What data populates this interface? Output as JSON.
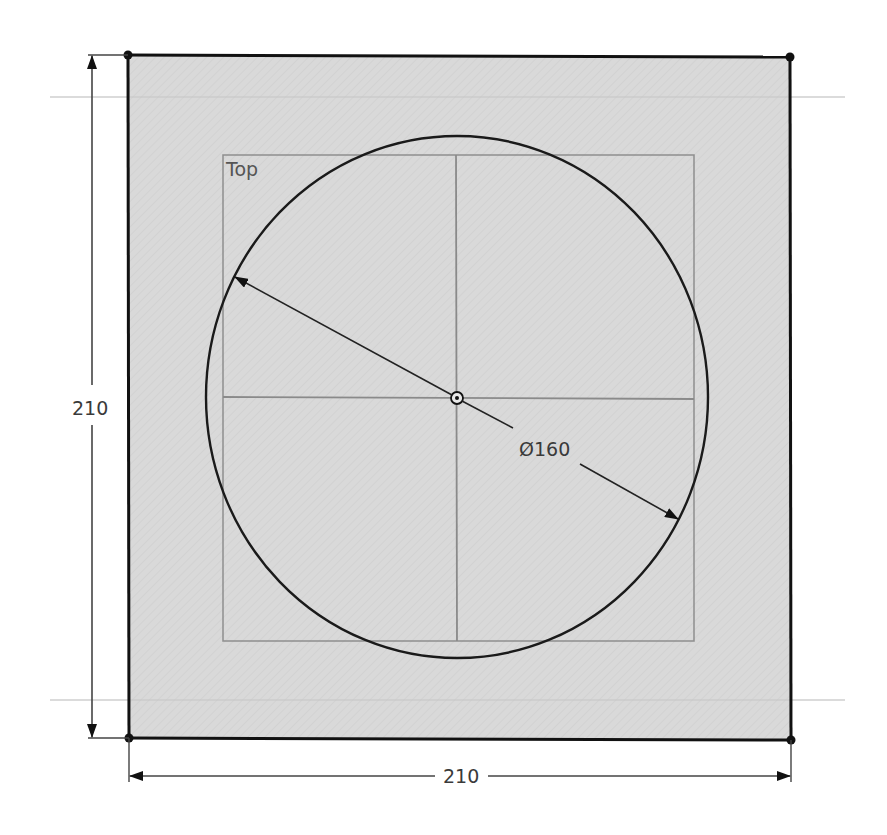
{
  "sketch": {
    "view_label": "Top",
    "plate": {
      "width": 210,
      "height": 210,
      "fill_color": "#d9d9d9",
      "edge_color": "#111111"
    },
    "circle": {
      "diameter_label": "Ø160",
      "diameter": 160,
      "edge_color": "#1a1a1a"
    },
    "dimensions": {
      "horizontal_label": "210",
      "vertical_label": "210"
    },
    "construction_line_color": "#bdbdbd",
    "view_box_color": "#8a8a8a",
    "icons": {
      "center_point": "center-point-icon",
      "vertex": "vertex-point-icon",
      "arrow": "dimension-arrow-icon"
    }
  }
}
